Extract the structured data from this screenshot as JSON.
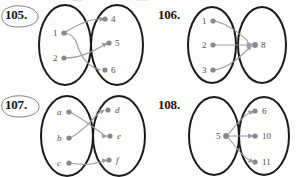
{
  "page": {
    "background_color": "#fdfdfc",
    "ellipse_stroke": "#1b1a1e",
    "node_color": "#8a888e",
    "arrow_color": "#9d9ba1",
    "label_color": "#4e4c52",
    "number_color": "#17161a",
    "annotation_color": "#6f6d73"
  },
  "problems": [
    {
      "id": "105",
      "number": "105.",
      "circled": true,
      "circle_annotation_name": "hand-drawn-circle-annotation",
      "left_set": {
        "name": "domain-oval",
        "nodes": [
          {
            "label": "1",
            "italic": false
          },
          {
            "label": "2",
            "italic": false
          }
        ]
      },
      "right_set": {
        "name": "codomain-oval",
        "nodes": [
          {
            "label": "4",
            "italic": false
          },
          {
            "label": "5",
            "italic": false
          },
          {
            "label": "6",
            "italic": false
          }
        ]
      },
      "arrows": [
        {
          "from": "1",
          "to": "4",
          "head_at": "4"
        },
        {
          "from": "2",
          "to": "5",
          "head_at": "5"
        },
        {
          "from": "6",
          "to": "1",
          "head_at": "1"
        }
      ]
    },
    {
      "id": "106",
      "number": "106.",
      "circled": false,
      "left_set": {
        "name": "domain-oval",
        "nodes": [
          {
            "label": "1",
            "italic": false
          },
          {
            "label": "2",
            "italic": false
          },
          {
            "label": "3",
            "italic": false
          }
        ]
      },
      "right_set": {
        "name": "codomain-oval",
        "nodes": [
          {
            "label": "8",
            "italic": false
          }
        ]
      },
      "arrows": [
        {
          "from": "1",
          "to": "8",
          "head_at": "8"
        },
        {
          "from": "2",
          "to": "8",
          "head_at": "8"
        },
        {
          "from": "3",
          "to": "8",
          "head_at": "8"
        }
      ]
    },
    {
      "id": "107",
      "number": "107.",
      "circled": true,
      "circle_annotation_name": "hand-drawn-circle-annotation",
      "left_set": {
        "name": "domain-oval",
        "nodes": [
          {
            "label": "a",
            "italic": true
          },
          {
            "label": "b",
            "italic": true
          },
          {
            "label": "c",
            "italic": true
          }
        ]
      },
      "right_set": {
        "name": "codomain-oval",
        "nodes": [
          {
            "label": "d",
            "italic": true
          },
          {
            "label": "e",
            "italic": true
          },
          {
            "label": "f",
            "italic": true
          }
        ]
      },
      "arrows": [
        {
          "from": "a",
          "to": "e",
          "head_at": "e"
        },
        {
          "from": "b",
          "to": "d",
          "head_at": "d"
        },
        {
          "from": "c",
          "to": "f",
          "head_at": "f"
        }
      ]
    },
    {
      "id": "108",
      "number": "108.",
      "circled": false,
      "left_set": {
        "name": "domain-oval",
        "nodes": [
          {
            "label": "5",
            "italic": false
          }
        ]
      },
      "right_set": {
        "name": "codomain-oval",
        "nodes": [
          {
            "label": "6",
            "italic": false
          },
          {
            "label": "10",
            "italic": false
          },
          {
            "label": "11",
            "italic": false
          }
        ]
      },
      "arrows": [
        {
          "from": "5",
          "to": "6",
          "head_at": "6"
        },
        {
          "from": "5",
          "to": "10",
          "head_at": "10"
        },
        {
          "from": "5",
          "to": "11",
          "head_at": "11"
        }
      ]
    }
  ]
}
